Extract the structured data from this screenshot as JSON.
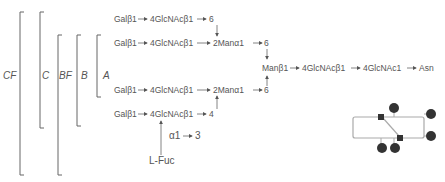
{
  "brackets": [
    {
      "label": "CF",
      "id": "cf"
    },
    {
      "label": "C",
      "id": "c"
    },
    {
      "label": "BF",
      "id": "bf"
    },
    {
      "label": "B",
      "id": "b"
    },
    {
      "label": "A",
      "id": "a"
    }
  ],
  "rows": {
    "row1": {
      "gal": "Galβ1",
      "glcnac": "4GlcNAcβ1",
      "link": "6"
    },
    "row2": {
      "gal": "Galβ1",
      "glcnac": "4GlcNAcβ1",
      "man": "2Manα1",
      "link": "6"
    },
    "row3": {
      "gal": "Galβ1",
      "glcnac": "4GlcNAcβ1",
      "man": "2Manα1",
      "link": "6"
    },
    "row4": {
      "gal": "Galβ1",
      "glcnac": "4GlcNAcβ1",
      "link": "4"
    }
  },
  "core": {
    "man": "Manβ1",
    "glcnac1": "4GlcNAcβ1",
    "glcnac2": "4GlcNAc1",
    "asn": "Asn"
  },
  "fucose": {
    "linkage_alpha": "α1",
    "linkage_pos": "3",
    "name": "L-Fuc"
  },
  "colors": {
    "line": "#555555",
    "text": "#555555",
    "schematic_line": "#aaaaaa",
    "node": "#333333"
  }
}
